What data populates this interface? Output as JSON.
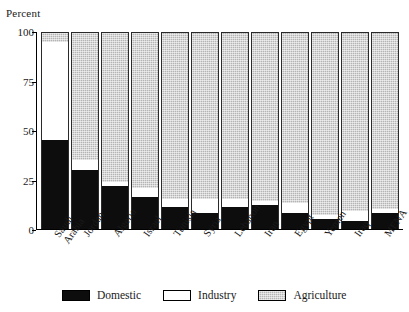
{
  "chart_data": {
    "type": "bar",
    "stacked": true,
    "stack_mode": "percent",
    "title": "",
    "subtitle": "",
    "xlabel": "",
    "ylabel": "Percent",
    "ylim": [
      0,
      100
    ],
    "yticks": [
      0,
      25,
      50,
      75,
      100
    ],
    "ytick_labels": [
      "0",
      "25",
      "50",
      "75",
      "100"
    ],
    "grid": false,
    "legend_position": "bottom",
    "categories": [
      "Saudi Arabia",
      "Jordan",
      "Algeria",
      "Israel",
      "Tunisia",
      "Syria",
      "Lebanon",
      "Iran",
      "Egypt",
      "Yemen",
      "Iraq",
      "MENA"
    ],
    "category_lines": [
      [
        "Saudi",
        "Arabia"
      ],
      [
        "Jordan"
      ],
      [
        "Algeria"
      ],
      [
        "Israel"
      ],
      [
        "Tunisia"
      ],
      [
        "Syria"
      ],
      [
        "Lebanon"
      ],
      [
        "Iran"
      ],
      [
        "Egypt"
      ],
      [
        "Yemen"
      ],
      [
        "Iraq"
      ],
      [
        "MENA"
      ]
    ],
    "series": [
      {
        "name": "Domestic",
        "color": "#0d0d0d",
        "values": [
          45,
          30,
          22,
          16,
          11,
          8,
          11,
          12,
          8,
          5,
          4,
          8
        ]
      },
      {
        "name": "Industry",
        "color": "#ffffff",
        "values": [
          50,
          5,
          2,
          5,
          4,
          7,
          4,
          2,
          5,
          2,
          5,
          2
        ]
      },
      {
        "name": "Agriculture",
        "color": "#b4b4b4",
        "values": [
          5,
          65,
          76,
          79,
          85,
          85,
          85,
          86,
          87,
          93,
          91,
          90
        ]
      }
    ]
  },
  "legend": {
    "items": [
      {
        "label": "Domestic",
        "swatch": "sw-domestic"
      },
      {
        "label": "Industry",
        "swatch": "sw-industry"
      },
      {
        "label": "Agriculture",
        "swatch": "sw-agriculture"
      }
    ]
  }
}
